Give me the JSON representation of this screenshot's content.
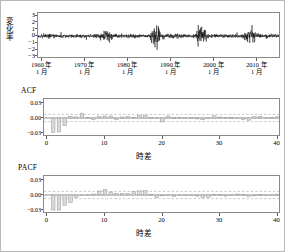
{
  "figure": {
    "background": "#ffffff",
    "frame_color": "#b9b9b9",
    "axis_color": "#8a8a8a",
    "bar_fill": "#d9d9d9",
    "bar_stroke": "#8f8f8f",
    "series_color": "#000000",
    "conf_band_color": "#9a9a9a"
  },
  "panels": {
    "series": {
      "ylabel": "変化率",
      "yticks": [
        "3",
        "2",
        "1",
        "0",
        "−1",
        "−2",
        "−3"
      ],
      "ytick_values": [
        3,
        2,
        1,
        0,
        -1,
        -2,
        -3
      ],
      "ylim": [
        -3.4,
        3.4
      ],
      "xticks": [
        {
          "year": "1960 年",
          "month": "1 月"
        },
        {
          "year": "1970 年",
          "month": "1 月"
        },
        {
          "year": "1980 年",
          "month": "1 月"
        },
        {
          "year": "1990 年",
          "month": "1 月"
        },
        {
          "year": "2000 年",
          "month": "1 月"
        },
        {
          "year": "2010 年",
          "month": "1 月"
        }
      ]
    },
    "acf": {
      "corner_label": "ACF",
      "yticks": [
        "0.03",
        "0.00",
        "−0.03"
      ],
      "ytick_values": [
        0.03,
        0.0,
        -0.03
      ],
      "xticks": [
        "0",
        "10",
        "20",
        "30",
        "40"
      ],
      "xtick_values": [
        0,
        10,
        20,
        30,
        40
      ],
      "xlabel": "時差"
    },
    "pacf": {
      "corner_label": "PACF",
      "yticks": [
        "0.03",
        "0.00",
        "−0.03"
      ],
      "ytick_values": [
        0.03,
        0.0,
        -0.03
      ],
      "xticks": [
        "0",
        "10",
        "20",
        "30",
        "40"
      ],
      "xtick_values": [
        0,
        10,
        20,
        30,
        40
      ],
      "xlabel": "時差"
    }
  },
  "chart_data": [
    {
      "type": "line",
      "id": "rate-of-change-series",
      "title": "",
      "xlabel": "",
      "ylabel": "変化率",
      "ylim": [
        -3.4,
        3.4
      ],
      "xlim": [
        1959.0,
        2015.5
      ],
      "grid": false,
      "x_tick_labels": [
        "1960 年 1 月",
        "1970 年 1 月",
        "1980 年 1 月",
        "1990 年 1 月",
        "2000 年 1 月",
        "2010 年 1 月"
      ],
      "x_tick_values": [
        1960,
        1970,
        1980,
        1990,
        2000,
        2010
      ],
      "y_tick_values": [
        3,
        2,
        1,
        0,
        -1,
        -2,
        -3
      ],
      "description": "High-frequency daily/monthly rate-of-change series oscillating about zero with volatility clusters",
      "volatility_clusters": [
        {
          "center": 1974.8,
          "peak_amplitude": 2.0
        },
        {
          "center": 1986.3,
          "peak_amplitude": 3.0
        },
        {
          "center": 1997.3,
          "peak_amplitude": 2.6
        },
        {
          "center": 2008.4,
          "peak_amplitude": 2.4
        }
      ],
      "baseline_amplitude": 0.55
    },
    {
      "type": "bar",
      "id": "acf",
      "title": "ACF",
      "xlabel": "時差",
      "ylabel": "",
      "ylim": [
        -0.038,
        0.038
      ],
      "xlim": [
        -0.6,
        40.6
      ],
      "grid": false,
      "conf_band": [
        -0.0072,
        0.0072
      ],
      "categories": [
        0,
        1,
        2,
        3,
        4,
        5,
        6,
        7,
        8,
        9,
        10,
        11,
        12,
        13,
        14,
        15,
        16,
        17,
        18,
        19,
        20,
        21,
        22,
        23,
        24,
        25,
        26,
        27,
        28,
        29,
        30,
        31,
        32,
        33,
        34,
        35,
        36,
        37,
        38,
        39,
        40
      ],
      "values": [
        0.0,
        -0.0285,
        -0.028,
        -0.0155,
        0.0035,
        0.0022,
        0.0098,
        0.0012,
        -0.003,
        0.003,
        0.0042,
        0.004,
        -0.0032,
        0.002,
        0.0034,
        0.001,
        0.0052,
        0.0058,
        0.0006,
        -0.0012,
        -0.0078,
        0.004,
        0.0008,
        0.0014,
        -0.0008,
        0.0005,
        -0.0018,
        -0.0036,
        -0.0004,
        0.0044,
        0.002,
        0.0008,
        0.001,
        -0.0014,
        -0.0032,
        -0.0044,
        0.0024,
        0.0028,
        -0.001,
        0.0012,
        0.0024
      ]
    },
    {
      "type": "bar",
      "id": "pacf",
      "title": "PACF",
      "xlabel": "時差",
      "ylabel": "",
      "ylim": [
        -0.038,
        0.038
      ],
      "xlim": [
        -0.6,
        40.6
      ],
      "grid": false,
      "conf_band": [
        -0.0072,
        0.0072
      ],
      "categories": [
        0,
        1,
        2,
        3,
        4,
        5,
        6,
        7,
        8,
        9,
        10,
        11,
        12,
        13,
        14,
        15,
        16,
        17,
        18,
        19,
        20,
        21,
        22,
        23,
        24,
        25,
        26,
        27,
        28,
        29,
        30,
        31,
        32,
        33,
        34,
        35,
        36,
        37,
        38,
        39,
        40
      ],
      "values": [
        0.0,
        -0.03,
        -0.0302,
        -0.0205,
        -0.015,
        -0.0046,
        -0.001,
        -0.0006,
        0.002,
        0.008,
        0.0112,
        0.006,
        0.003,
        0.003,
        0.0032,
        0.0068,
        0.0082,
        0.0086,
        0.0014,
        -0.005,
        -0.0016,
        -0.0008,
        -0.003,
        -0.0012,
        -0.0008,
        -0.001,
        -0.0022,
        -0.0052,
        -0.0044,
        0.0012,
        0.0006,
        -0.0022,
        -0.0012,
        0.0018,
        0.001,
        -0.0026,
        -0.0018,
        0.0008,
        -0.0014,
        -0.0008,
        0.0006
      ]
    }
  ]
}
